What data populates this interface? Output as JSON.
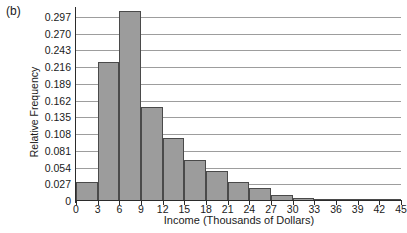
{
  "figure": {
    "panel_label": "(b)"
  },
  "chart_data": {
    "type": "bar",
    "title": "",
    "xlabel": "Income (Thousands of Dollars)",
    "ylabel": "Relative Frequency",
    "grid": true,
    "legend": "none",
    "xlim": [
      0,
      45
    ],
    "ylim": [
      0,
      0.31
    ],
    "bin_width": 3,
    "x_tick_labels": [
      "0",
      "3",
      "6",
      "9",
      "12",
      "15",
      "18",
      "21",
      "24",
      "27",
      "30",
      "33",
      "36",
      "39",
      "42",
      "45"
    ],
    "x_tick_values": [
      0,
      3,
      6,
      9,
      12,
      15,
      18,
      21,
      24,
      27,
      30,
      33,
      36,
      39,
      42,
      45
    ],
    "y_tick_labels": [
      "0",
      "0.027",
      "0.054",
      "0.081",
      "0.108",
      "0.135",
      "0.162",
      "0.189",
      "0.216",
      "0.243",
      "0.270",
      "0.297"
    ],
    "y_tick_values": [
      0,
      0.027,
      0.054,
      0.081,
      0.108,
      0.135,
      0.162,
      0.189,
      0.216,
      0.243,
      0.27,
      0.297
    ],
    "bin_edges": [
      0,
      3,
      6,
      9,
      12,
      15,
      18,
      21,
      24,
      27,
      30,
      33,
      36,
      39,
      42,
      45
    ],
    "categories": [
      "0-3",
      "3-6",
      "6-9",
      "9-12",
      "12-15",
      "15-18",
      "18-21",
      "21-24",
      "24-27",
      "27-30",
      "30-33",
      "33-36",
      "36-39",
      "39-42",
      "42-45"
    ],
    "values": [
      0.031,
      0.224,
      0.307,
      0.152,
      0.102,
      0.067,
      0.049,
      0.031,
      0.021,
      0.01,
      0.005,
      0.004,
      0.003,
      0.002,
      0.002
    ],
    "bar_color": "#9c9c9c",
    "bar_edge_color": "#4a4a4a",
    "grid_color": "#9d9d9d",
    "axis_color": "#2b2b2b"
  }
}
